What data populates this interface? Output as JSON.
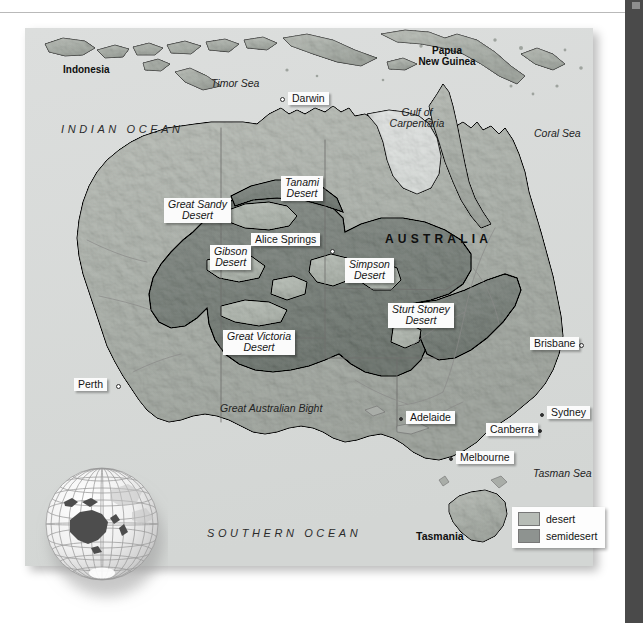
{
  "map": {
    "title": "Deserts of Australia",
    "continent_label": "AUSTRALIA",
    "oceans": [
      {
        "name": "INDIAN OCEAN"
      },
      {
        "name": "SOUTHERN OCEAN"
      }
    ],
    "seas": [
      {
        "name": "Timor Sea"
      },
      {
        "name": "Gulf of Carpentaria"
      },
      {
        "name": "Coral Sea"
      },
      {
        "name": "Great Australian Bight"
      },
      {
        "name": "Tasman Sea"
      }
    ],
    "countries": [
      {
        "name": "Indonesia"
      },
      {
        "name": "Papua New Guinea"
      }
    ],
    "islands": [
      {
        "name": "Tasmania"
      }
    ],
    "cities": [
      {
        "name": "Darwin"
      },
      {
        "name": "Alice Springs"
      },
      {
        "name": "Brisbane"
      },
      {
        "name": "Perth"
      },
      {
        "name": "Adelaide"
      },
      {
        "name": "Canberra"
      },
      {
        "name": "Sydney"
      },
      {
        "name": "Melbourne"
      }
    ],
    "deserts": [
      {
        "name": "Great Sandy Desert",
        "line1": "Great Sandy",
        "line2": "Desert"
      },
      {
        "name": "Tanami Desert",
        "line1": "Tanami",
        "line2": "Desert"
      },
      {
        "name": "Gibson Desert",
        "line1": "Gibson",
        "line2": "Desert"
      },
      {
        "name": "Simpson Desert",
        "line1": "Simpson",
        "line2": "Desert"
      },
      {
        "name": "Great Victoria Desert",
        "line1": "Great Victoria",
        "line2": "Desert"
      },
      {
        "name": "Sturt Stoney Desert",
        "line1": "Sturt Stoney",
        "line2": "Desert"
      }
    ],
    "legend": {
      "items": [
        {
          "label": "desert",
          "color": "#b7bcb6"
        },
        {
          "label": "semidesert",
          "color": "#8e9390"
        }
      ]
    },
    "colors": {
      "ocean": "#d9dbda",
      "land": "#b4b8b3",
      "desert": "#b7bcb6",
      "semidesert": "#8e9390",
      "outline": "#5c5c5c",
      "right_bar": "#4a4a4a"
    },
    "inset": {
      "name": "globe-locator",
      "description": "wireframe globe with Australia highlighted"
    }
  }
}
